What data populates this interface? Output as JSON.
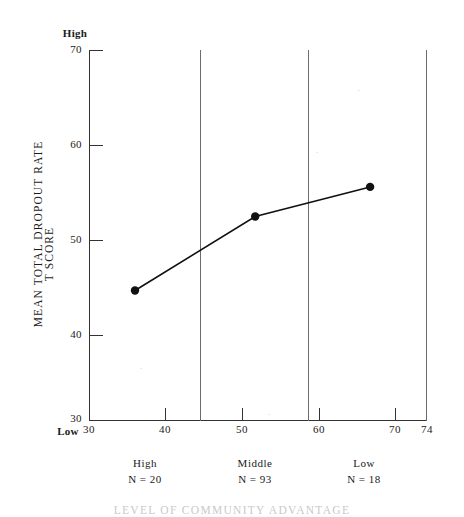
{
  "chart_data": {
    "type": "line",
    "title": "LEVEL OF COMMUNITY ADVANTAGE",
    "xlabel": "LEVEL OF COMMUNITY ADVANTAGE",
    "ylabel": "MEAN TOTAL DROPOUT RATE",
    "ylabel_secondary": "T SCORE",
    "xlim": [
      30,
      74
    ],
    "ylim": [
      30,
      70
    ],
    "grid": false,
    "legend": "none",
    "y_ticks": [
      70,
      60,
      50,
      40,
      30
    ],
    "y_tick_labels": [
      "70",
      "60",
      "50",
      "40",
      "30"
    ],
    "y_axis_anchor_high": "High",
    "y_axis_anchor_low": "Low",
    "x_ticks": [
      30,
      40,
      50,
      60,
      70,
      74
    ],
    "x_tick_labels": [
      "30",
      "40",
      "50",
      "60",
      "70",
      "74"
    ],
    "x_dividers": [
      44.5,
      58.5
    ],
    "x": [
      36.0,
      51.7,
      66.7
    ],
    "values": [
      44.0,
      52.0,
      55.2
    ],
    "points": [
      {
        "x": 36.0,
        "y": 44.0
      },
      {
        "x": 51.7,
        "y": 52.0
      },
      {
        "x": 66.7,
        "y": 55.2
      }
    ],
    "groups": [
      {
        "name": "High",
        "n_label": "N  =  20",
        "n": 20,
        "center_x": 37.2
      },
      {
        "name": "Middle",
        "n_label": "N  = 93",
        "n": 93,
        "center_x": 51.5
      },
      {
        "name": "Low",
        "n_label": "N  =  18",
        "n": 18,
        "center_x": 66.3
      }
    ],
    "line_color": "#111111",
    "marker_color": "#111111",
    "axis_color": "#333333",
    "divider_color": "#6b6b6b",
    "background_color": "#ffffff"
  }
}
